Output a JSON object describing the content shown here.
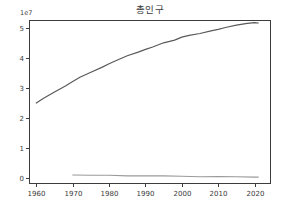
{
  "figure": {
    "background": "#ffffff",
    "axis_color": "#3c3c3c",
    "tick_label_color": "#3a3a3a"
  },
  "chart_data": {
    "type": "line",
    "title": "총인구",
    "y_offset_label": "1e7",
    "xlabel": "",
    "ylabel": "",
    "grid": false,
    "legend": "none",
    "xlim": [
      1958,
      2024.5
    ],
    "ylim": [
      -0.2,
      5.27
    ],
    "x_ticks": [
      "1960",
      "1970",
      "1980",
      "1990",
      "2000",
      "2010",
      "2020"
    ],
    "x_tick_values": [
      1960,
      1970,
      1980,
      1990,
      2000,
      2010,
      2020
    ],
    "y_ticks": [
      "0",
      "1",
      "2",
      "3",
      "4",
      "5"
    ],
    "y_tick_values": [
      0,
      1,
      2,
      3,
      4,
      5
    ],
    "series": [
      {
        "name": "총인구",
        "color": "#5a5a5a",
        "width": 1.2,
        "x": [
          1960,
          1962,
          1965,
          1968,
          1970,
          1972,
          1975,
          1978,
          1980,
          1982,
          1985,
          1988,
          1990,
          1992,
          1995,
          1998,
          2000,
          2002,
          2005,
          2008,
          2010,
          2012,
          2015,
          2018,
          2020,
          2021
        ],
        "values": [
          2.5,
          2.66,
          2.87,
          3.07,
          3.22,
          3.36,
          3.53,
          3.69,
          3.81,
          3.92,
          4.08,
          4.2,
          4.29,
          4.37,
          4.51,
          4.6,
          4.7,
          4.76,
          4.82,
          4.91,
          4.96,
          5.02,
          5.1,
          5.16,
          5.18,
          5.17
        ]
      },
      {
        "name": "unlabeled-lower-series",
        "color": "#9a9a9a",
        "width": 1.1,
        "x": [
          1970,
          1975,
          1980,
          1985,
          1990,
          1995,
          2000,
          2005,
          2010,
          2015,
          2020,
          2021
        ],
        "values": [
          0.1,
          0.09,
          0.09,
          0.07,
          0.07,
          0.07,
          0.06,
          0.04,
          0.05,
          0.04,
          0.03,
          0.03
        ]
      }
    ]
  }
}
